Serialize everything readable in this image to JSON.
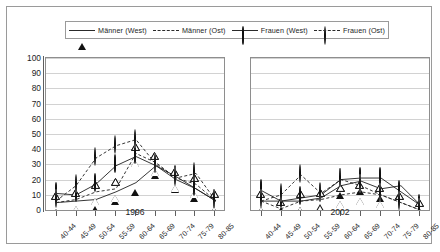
{
  "legend": {
    "items": [
      {
        "label": "Männer (West)",
        "marker": "triangle-filled",
        "line": "solid",
        "color": "#111111"
      },
      {
        "label": "Männer (Ost)",
        "marker": "triangle-open",
        "line": "dashed",
        "color": "#111111"
      },
      {
        "label": "Frauen (West)",
        "marker": "circle-filled",
        "line": "solid",
        "color": "#111111"
      },
      {
        "label": "Frauen (Ost)",
        "marker": "circle-open",
        "line": "dashed",
        "color": "#111111"
      }
    ]
  },
  "yaxis": {
    "ticks": [
      "100",
      "90",
      "80",
      "70",
      "60",
      "50",
      "40",
      "30",
      "20",
      "10",
      "0"
    ],
    "min": 0,
    "max": 100,
    "step": 10
  },
  "chart_data": [
    {
      "type": "line",
      "title": "1996",
      "xlabel": "",
      "ylabel": "",
      "ylim": [
        0,
        100
      ],
      "grid": true,
      "legend_position": "top",
      "categories": [
        "40-44",
        "45-49",
        "50-54",
        "55-59",
        "60-64",
        "65-69",
        "70-74",
        "75-79",
        "80-85"
      ],
      "series": [
        {
          "name": "Männer (West)",
          "marker": "triangle-filled",
          "line": "solid",
          "values": [
            6,
            7,
            8,
            13,
            19,
            30,
            21,
            15,
            7
          ]
        },
        {
          "name": "Männer (Ost)",
          "marker": "triangle-open",
          "line": "dashed",
          "values": [
            6,
            8,
            13,
            15,
            38,
            32,
            22,
            18,
            7
          ]
        },
        {
          "name": "Frauen (West)",
          "marker": "circle-filled",
          "line": "solid",
          "values": [
            12,
            11,
            18,
            30,
            36,
            30,
            23,
            15,
            7
          ]
        },
        {
          "name": "Frauen (Ost)",
          "marker": "circle-open",
          "line": "dashed",
          "values": [
            7,
            17,
            35,
            43,
            47,
            31,
            22,
            25,
            7
          ]
        }
      ]
    },
    {
      "type": "line",
      "title": "2002",
      "xlabel": "",
      "ylabel": "",
      "ylim": [
        0,
        100
      ],
      "grid": true,
      "legend_position": "top",
      "categories": [
        "40-44",
        "45-49",
        "50-54",
        "55-59",
        "60-64",
        "65-69",
        "70-74",
        "75-79",
        "80-85"
      ],
      "series": [
        {
          "name": "Männer (West)",
          "marker": "triangle-filled",
          "line": "solid",
          "values": [
            7,
            7,
            7,
            9,
            17,
            20,
            15,
            17,
            4
          ]
        },
        {
          "name": "Männer (Ost)",
          "marker": "triangle-open",
          "line": "dashed",
          "values": [
            7,
            2,
            7,
            8,
            11,
            13,
            11,
            6,
            1
          ]
        },
        {
          "name": "Frauen (West)",
          "marker": "circle-filled",
          "line": "solid",
          "values": [
            14,
            7,
            9,
            11,
            21,
            22,
            22,
            13,
            4
          ]
        },
        {
          "name": "Frauen (Ost)",
          "marker": "circle-open",
          "line": "dashed",
          "values": [
            7,
            11,
            24,
            12,
            21,
            17,
            11,
            6,
            1
          ]
        }
      ]
    }
  ]
}
